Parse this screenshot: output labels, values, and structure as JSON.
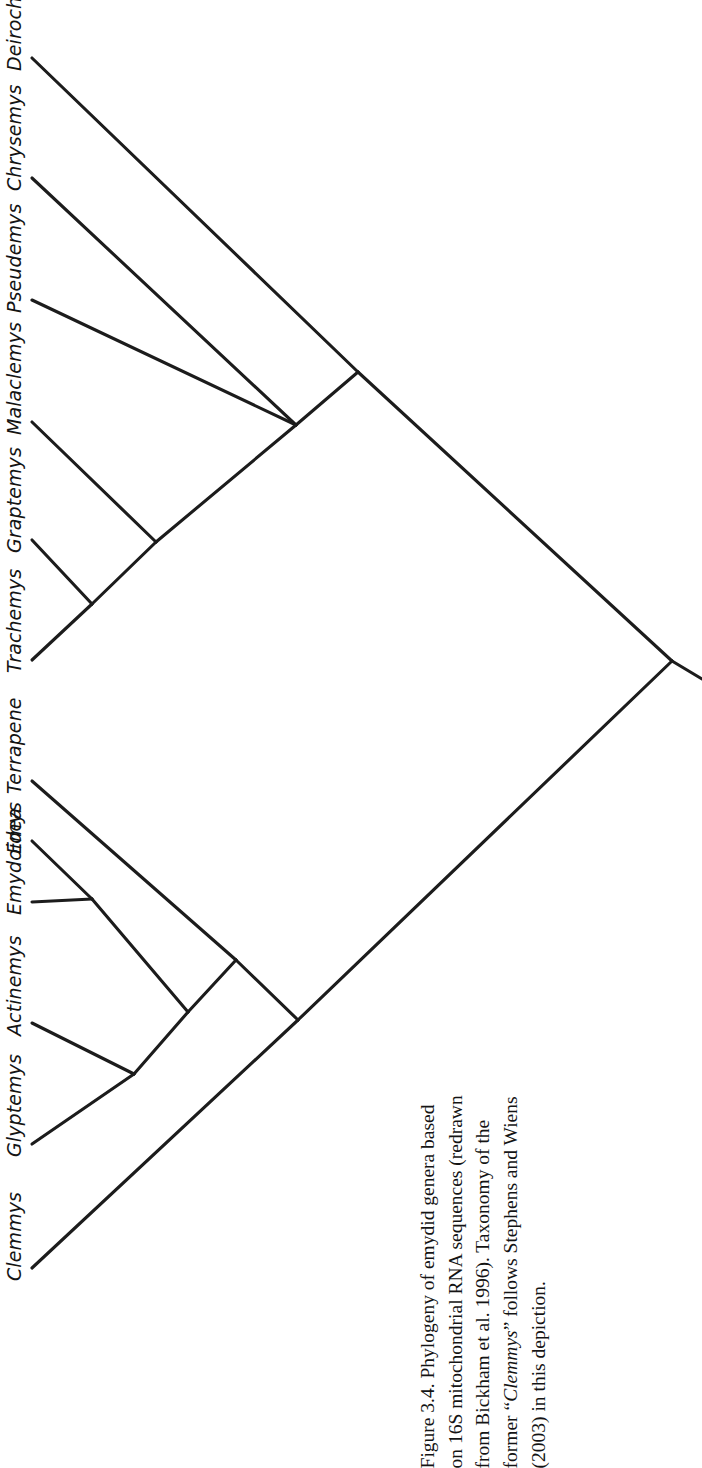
{
  "figure": {
    "number": "Figure 3.4.",
    "caption_lines": [
      "Figure 3.4. Phylogeny of emydid genera based",
      "on 16S mitochondrial RNA sequences (redrawn",
      "from Bickham et al. 1996). Taxonomy of the",
      "former “Clemmys” follows Stephens and Wiens",
      "(2003) in this depiction."
    ],
    "caption_full": "Figure 3.4. Phylogeny of emydid genera based on 16S mitochondrial RNA sequences (redrawn from Bickham et al. 1996). Taxonomy of the former “Clemmys” follows Stephens and Wiens (2003) in this depiction.",
    "caption_italic_term": "Clemmys",
    "orientation": "rotated-90-ccw",
    "line_color": "#1c1c1c",
    "background_color": "#ffffff"
  },
  "chart_data": {
    "type": "cladogram",
    "source": "redrawn from Bickham et al. 1996",
    "taxonomy_note": "Taxonomy of the former “Clemmys” follows Stephens and Wiens (2003)",
    "leaf_count": 12,
    "orientation": "diagonal, tips at left edge, root at right",
    "taxa": [
      {
        "id": "deirochelys",
        "label": "Deirochelys",
        "tip_x": 32,
        "tip_y": 58
      },
      {
        "id": "chrysemys",
        "label": "Chrysemys",
        "tip_x": 32,
        "tip_y": 178
      },
      {
        "id": "pseudemys",
        "label": "Pseudemys",
        "tip_x": 32,
        "tip_y": 300
      },
      {
        "id": "malaclemys",
        "label": "Malaclemys",
        "tip_x": 32,
        "tip_y": 422
      },
      {
        "id": "graptemys",
        "label": "Graptemys",
        "tip_x": 32,
        "tip_y": 540
      },
      {
        "id": "trachemys",
        "label": "Trachemys",
        "tip_x": 32,
        "tip_y": 660
      },
      {
        "id": "terrapene",
        "label": "Terrapene",
        "tip_x": 32,
        "tip_y": 781
      },
      {
        "id": "emys",
        "label": "Emys",
        "tip_x": 32,
        "tip_y": 841
      },
      {
        "id": "emydoidea",
        "label": "Emydoidea",
        "tip_x": 32,
        "tip_y": 902
      },
      {
        "id": "actinemys",
        "label": "Actinemys",
        "tip_x": 32,
        "tip_y": 1023
      },
      {
        "id": "glyptemys",
        "label": "Glyptemys",
        "tip_x": 32,
        "tip_y": 1144
      },
      {
        "id": "clemmys",
        "label": "Clemmys",
        "tip_x": 32,
        "tip_y": 1268
      }
    ],
    "internal_nodes": [
      {
        "id": "node-root",
        "x": 672,
        "y": 661,
        "children": [
          "node-deirochelyinae",
          "node-emydinae"
        ]
      },
      {
        "id": "node-deirochelyinae",
        "x": 358,
        "y": 372,
        "children": [
          "deirochelys",
          "node-chrysemys-clade"
        ]
      },
      {
        "id": "node-chrysemys-clade",
        "x": 296,
        "y": 425,
        "children": [
          "chrysemys",
          "pseudemys",
          "node-malaclemys-clade"
        ]
      },
      {
        "id": "node-malaclemys-clade",
        "x": 156,
        "y": 542,
        "children": [
          "malaclemys",
          "node-graptemys-trachemys"
        ]
      },
      {
        "id": "node-graptemys-trachemys",
        "x": 92,
        "y": 604,
        "children": [
          "graptemys",
          "trachemys"
        ]
      },
      {
        "id": "node-emydinae",
        "x": 298,
        "y": 1020,
        "children": [
          "node-terrapene-clade",
          "clemmys"
        ]
      },
      {
        "id": "node-terrapene-clade",
        "x": 236,
        "y": 960,
        "children": [
          "terrapene",
          "node-emys-clade"
        ]
      },
      {
        "id": "node-emys-clade",
        "x": 188,
        "y": 1012,
        "children": [
          "node-emys-emydoidea",
          "node-actinemys-glyptemys"
        ]
      },
      {
        "id": "node-emys-emydoidea",
        "x": 92,
        "y": 899,
        "children": [
          "emys",
          "emydoidea"
        ]
      },
      {
        "id": "node-actinemys-glyptemys",
        "x": 134,
        "y": 1074,
        "children": [
          "actinemys",
          "glyptemys"
        ]
      }
    ],
    "axis": {
      "x": false,
      "y": false
    },
    "grid": false,
    "legend": null
  },
  "labels": {
    "taxa": [
      "Deirochelys",
      "Chrysemys",
      "Pseudemys",
      "Malaclemys",
      "Graptemys",
      "Trachemys",
      "Terrapene",
      "Emys",
      "Emydoidea",
      "Actinemys",
      "Glyptemys",
      "Clemmys"
    ]
  }
}
